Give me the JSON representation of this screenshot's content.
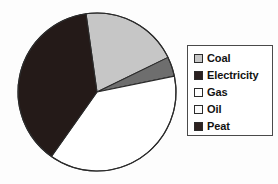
{
  "background_color": "#fdfdfd",
  "legend": {
    "position": "right",
    "border_color": "#4a4a4a",
    "background_color": "#ffffff",
    "entries": [
      {
        "label": "Coal",
        "color": "#c6c6c6"
      },
      {
        "label": "Electricity",
        "color": "#2a2020"
      },
      {
        "label": "Gas",
        "color": "#ffffff"
      },
      {
        "label": "Oil",
        "color": "#fbfbfb"
      },
      {
        "label": "Peat",
        "color": "#2e2220"
      }
    ]
  },
  "chart_data": {
    "type": "pie",
    "title": "",
    "subtitle": "",
    "xlabel": "",
    "ylabel": "",
    "legend_position": "right",
    "grid": false,
    "center_x": 97,
    "center_y": 92,
    "radius": 79,
    "start_angle_deg": -98,
    "direction": "clockwise",
    "outline_color": "#2b2b2b",
    "categories": [
      "Coal",
      "Electricity",
      "Gas",
      "Oil",
      "Peat"
    ],
    "values": [
      20,
      4,
      38,
      0,
      38
    ],
    "slice_colors": [
      "#c6c6c6",
      "#6e6e6e",
      "#ffffff",
      "#fbfbfb",
      "#241a18"
    ],
    "slices": [
      {
        "label": "Coal",
        "value": 20,
        "percent": 20,
        "angle_deg": 72,
        "color": "#c6c6c6"
      },
      {
        "label": "Electricity",
        "value": 4,
        "percent": 4,
        "angle_deg": 14,
        "color": "#6e6e6e"
      },
      {
        "label": "Gas",
        "value": 38,
        "percent": 38,
        "angle_deg": 137,
        "color": "#ffffff"
      },
      {
        "label": "Oil",
        "value": 0,
        "percent": 0,
        "angle_deg": 0,
        "color": "#fbfbfb"
      },
      {
        "label": "Peat",
        "value": 38,
        "percent": 38,
        "angle_deg": 137,
        "color": "#241a18"
      }
    ]
  }
}
